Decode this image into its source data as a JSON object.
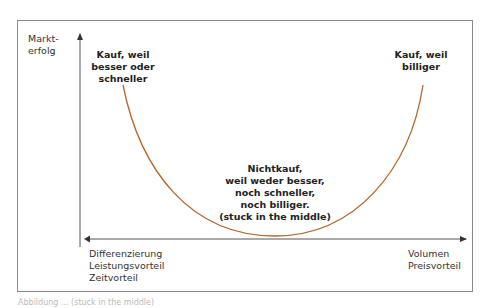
{
  "diagram": {
    "y_axis_label": "Markt-\nerfolg",
    "x_axis_left_label": "Differenzierung\nLeistungsvorteil\nZeitvorteil",
    "x_axis_right_label": "Volumen\nPreisvorteil",
    "left_peak_label": "Kauf, weil\nbesser oder\nschneller",
    "right_peak_label": "Kauf, weil\nbilliger",
    "trough_label": "Nichtkauf,\nweil weder besser,\nnoch schneller,\nnoch billiger.\n(stuck in the middle)",
    "curve_color": "#b5662a",
    "axis_color": "#333333",
    "frame_color": "#8a8a8a"
  },
  "caption": "Abbildung ... (stuck in the middle)"
}
